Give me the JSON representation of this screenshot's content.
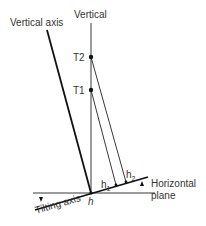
{
  "diagram": {
    "labels": {
      "vertical_axis": "Vertical axis",
      "vertical": "Vertical",
      "t2": "T2",
      "t1": "T1",
      "h1_base": "h",
      "h1_sub": "1",
      "h2_base": "h",
      "h2_sub": "2",
      "h": "h",
      "horizontal_plane_line1": "Horizontal",
      "horizontal_plane_line2": "plane",
      "tilting_axis": "Tilting axis"
    },
    "colors": {
      "line": "#1a1a1a",
      "text": "#333333"
    }
  }
}
